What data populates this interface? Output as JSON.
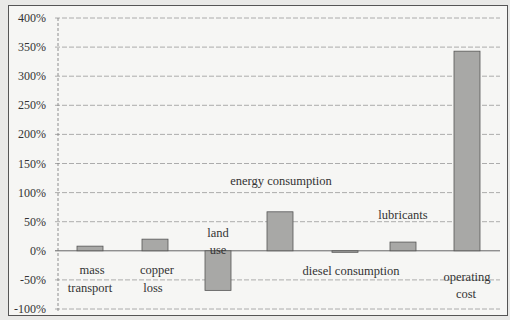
{
  "chart_data": {
    "type": "bar",
    "title": "",
    "xlabel": "",
    "ylabel": "",
    "ylim": [
      -100,
      400
    ],
    "yticks": [
      "400%",
      "350%",
      "300%",
      "250%",
      "200%",
      "150%",
      "100%",
      "50%",
      "0%",
      "-50%",
      "-100%"
    ],
    "grid": true,
    "legend": "none",
    "categories": [
      "mass transport",
      "copper loss",
      "land use",
      "energy consumption",
      "diesel consumption",
      "lubricants",
      "operating cost"
    ],
    "values": [
      8,
      20,
      -68,
      67,
      -1,
      15,
      343
    ],
    "unit": "%",
    "bar_color": "#a8a8a6"
  },
  "labels": {
    "mass": "mass",
    "transport": "transport",
    "copper": "copper",
    "loss": "loss",
    "land": "land",
    "use": "use",
    "energy": "energy consumption",
    "diesel": "diesel consumption",
    "lubricants": "lubricants",
    "operating": "operating",
    "cost": "cost"
  }
}
